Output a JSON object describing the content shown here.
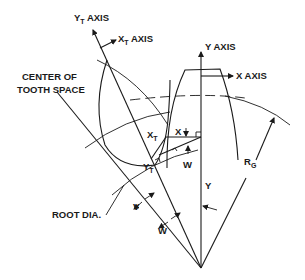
{
  "figure": {
    "labels": {
      "yt_axis": {
        "main": "Y",
        "sub": "T",
        "rest": " AXIS"
      },
      "xt_axis": {
        "main": "X",
        "sub": "T",
        "rest": " AXIS"
      },
      "y_axis": "Y  AXIS",
      "x_axis": "X AXIS",
      "center_line1": "CENTER OF",
      "center_line2": "TOOTH SPACE",
      "xt": {
        "main": "X",
        "sub": "T"
      },
      "yt": {
        "main": "Y",
        "sub": "T"
      },
      "x": "X",
      "w_upper": "W",
      "y": "Y",
      "rg": {
        "main": "R",
        "sub": "G"
      },
      "root_dia": "ROOT DIA.",
      "v": "V",
      "w_lower": "W"
    },
    "colors": {
      "ink": "#1a1a1a",
      "background": "#ffffff"
    }
  }
}
